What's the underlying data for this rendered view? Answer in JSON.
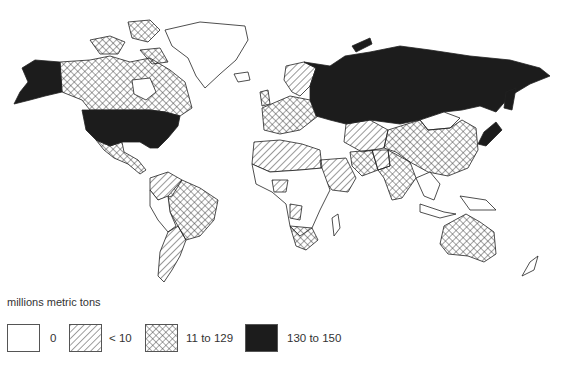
{
  "map": {
    "type": "choropleth",
    "projection": "world",
    "regions": [
      {
        "name": "United States",
        "class": "130 to 150"
      },
      {
        "name": "Alaska",
        "class": "130 to 150"
      },
      {
        "name": "Russia / USSR",
        "class": "130 to 150"
      },
      {
        "name": "Canada",
        "class": "11 to 129"
      },
      {
        "name": "Canadian Arctic Islands",
        "class": "11 to 129"
      },
      {
        "name": "Mexico",
        "class": "11 to 129"
      },
      {
        "name": "Brazil",
        "class": "11 to 129"
      },
      {
        "name": "China",
        "class": "11 to 129"
      },
      {
        "name": "India",
        "class": "11 to 129"
      },
      {
        "name": "Australia",
        "class": "11 to 129"
      },
      {
        "name": "South Africa",
        "class": "11 to 129"
      },
      {
        "name": "Western Europe",
        "class": "11 to 129"
      },
      {
        "name": "Iran",
        "class": "11 to 129"
      },
      {
        "name": "Scandinavia",
        "class": "< 10"
      },
      {
        "name": "Argentina",
        "class": "< 10"
      },
      {
        "name": "Venezuela / Colombia",
        "class": "< 10"
      },
      {
        "name": "North Africa (Algeria, Libya, Egypt)",
        "class": "< 10"
      },
      {
        "name": "Saudi Arabia",
        "class": "< 10"
      },
      {
        "name": "Kazakhstan region",
        "class": "< 10"
      },
      {
        "name": "Pakistan",
        "class": "< 10"
      },
      {
        "name": "Greenland",
        "class": "0"
      },
      {
        "name": "Central Africa",
        "class": "0"
      },
      {
        "name": "Mongolia",
        "class": "0"
      },
      {
        "name": "Southeast Asia",
        "class": "0"
      },
      {
        "name": "New Zealand",
        "class": "0"
      }
    ]
  },
  "legend": {
    "title": "millions metric tons",
    "items": [
      {
        "label": "0",
        "fill": "none"
      },
      {
        "label": "< 10",
        "fill": "diagonal-hatch"
      },
      {
        "label": "11 to 129",
        "fill": "crosshatch"
      },
      {
        "label": "130 to 150",
        "fill": "solid",
        "color": "#1c1c1c"
      }
    ]
  }
}
